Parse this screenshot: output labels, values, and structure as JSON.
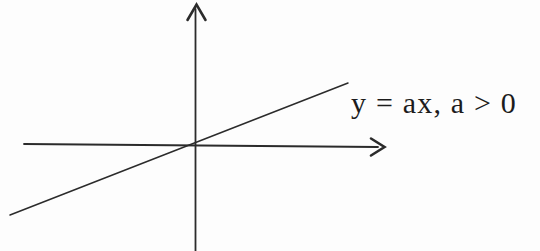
{
  "figure": {
    "label": "y = ax, a > 0",
    "ink_color": "#2b2b2b",
    "text_color": "#1c1c1c",
    "background_color": "#fdfdfd"
  }
}
